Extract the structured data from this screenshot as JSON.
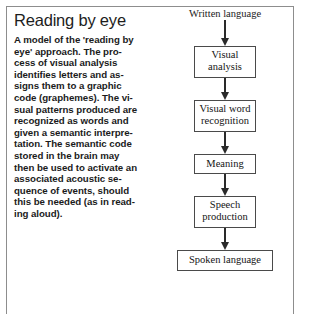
{
  "figure": {
    "title": "Reading by eye",
    "body_lines": [
      "A model of the 'reading by",
      "eye' approach. The pro-",
      "cess of visual analysis",
      "identifies letters and as-",
      "signs them to a graphic",
      "code (graphemes). The vi-",
      "sual patterns produced are",
      "recognized as words and",
      "given a semantic interpre-",
      "tation. The semantic code",
      "stored in the brain may",
      "then be used to activate an",
      "associated acoustic se-",
      "quence of events, should",
      "this be needed (as in read-",
      "ing aloud)."
    ]
  },
  "flowchart": {
    "start_label": "Written language",
    "end_label": "Spoken language",
    "steps": [
      {
        "line1": "Visual",
        "line2": "analysis"
      },
      {
        "line1": "Visual word",
        "line2": "recognition"
      },
      {
        "line1": "Meaning",
        "line2": ""
      },
      {
        "line1": "Speech",
        "line2": "production"
      }
    ]
  },
  "colors": {
    "frame": "#8d8d8d",
    "box_border": "#4a4a4a",
    "arrow": "#2a2a2a",
    "text": "#1b1b1b",
    "background": "#ffffff"
  }
}
